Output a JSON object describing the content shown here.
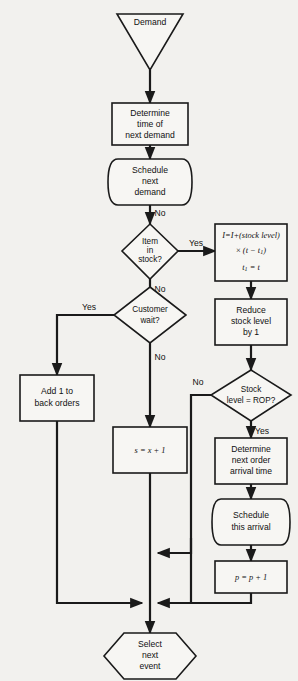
{
  "diagram": {
    "colors": {
      "background": "#f2f1ee",
      "shape_fill": "#f7f6f3",
      "line": "#1a1a1a"
    },
    "nodes": {
      "demand": {
        "label": "Demand",
        "shape": "triangle"
      },
      "determine_time": {
        "line1": "Determine",
        "line2": "time of",
        "line3": "next demand",
        "shape": "process"
      },
      "schedule_demand": {
        "line1": "Schedule",
        "line2": "next",
        "line3": "demand",
        "shape": "curved"
      },
      "item_in_stock": {
        "line1": "Item",
        "line2": "in",
        "line3": "stock?",
        "shape": "decision"
      },
      "update_i": {
        "line1": "I=I+(stock  level)",
        "line2_pre": "x",
        "line2": "(t − t",
        "line2_sub": "1",
        "line2_post": ")",
        "line3": "t",
        "line3_sub": "1",
        "line3_post": "= t",
        "shape": "process"
      },
      "reduce_stock": {
        "line1": "Reduce",
        "line2": "stock  level",
        "line3": "by  1",
        "shape": "process"
      },
      "customer_wait": {
        "line1": "Customer",
        "line2": "wait?",
        "shape": "decision"
      },
      "add_back_orders": {
        "line1": "Add  1  to",
        "line2": "back  orders",
        "shape": "process"
      },
      "stock_rop": {
        "line1": "Stock",
        "line2": "level  =  ROP?",
        "shape": "decision"
      },
      "increment_s": {
        "label": "s  =  x  +  1",
        "shape": "process"
      },
      "determine_arrival": {
        "line1": "Determine",
        "line2": "next  order",
        "line3": "arrival  time",
        "shape": "process"
      },
      "schedule_arrival": {
        "line1": "Schedule",
        "line2": "this  arrival",
        "shape": "curved"
      },
      "increment_p": {
        "label": "p  =  p  +  1",
        "shape": "process"
      },
      "select_next_event": {
        "line1": "Select",
        "line2": "next",
        "line3": "event",
        "shape": "hexagon"
      }
    },
    "edge_labels": {
      "schedule_no": "No",
      "item_yes": "Yes",
      "item_no": "No",
      "wait_yes": "Yes",
      "wait_no": "No",
      "rop_no": "No",
      "rop_yes": "Yes"
    }
  }
}
